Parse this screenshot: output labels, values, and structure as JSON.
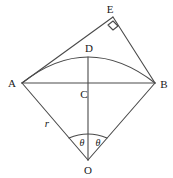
{
  "figure": {
    "background_color": "#ffffff",
    "stroke_color": "#4a4a4a",
    "text_color": "#1a1a1a",
    "width": 173,
    "height": 178
  },
  "points": {
    "A": {
      "label": "A",
      "x": 22,
      "y": 83,
      "label_x": 12,
      "label_y": 83
    },
    "B": {
      "label": "B",
      "x": 155,
      "y": 83,
      "label_x": 164,
      "label_y": 84
    },
    "C": {
      "label": "C",
      "x": 88,
      "y": 83,
      "label_x": 84,
      "label_y": 94
    },
    "D": {
      "label": "D",
      "x": 88,
      "y": 57,
      "label_x": 89,
      "label_y": 48
    },
    "E": {
      "label": "E",
      "x": 113,
      "y": 17,
      "label_x": 110,
      "label_y": 9
    },
    "O": {
      "label": "O",
      "x": 88,
      "y": 160,
      "label_x": 88,
      "label_y": 170
    }
  },
  "annotations": {
    "radius": {
      "label": "r",
      "x": 47,
      "y": 123
    },
    "angle_left": {
      "label": "θ",
      "x": 82,
      "y": 143
    },
    "angle_right": {
      "label": "θ",
      "x": 98,
      "y": 143
    },
    "right_angle_marker": {
      "at": "E",
      "present": true
    }
  },
  "segments": [
    {
      "name": "chord-AB",
      "from": "A",
      "to": "B"
    },
    {
      "name": "side-AE",
      "from": "A",
      "to": "E"
    },
    {
      "name": "side-EB",
      "from": "E",
      "to": "B"
    },
    {
      "name": "radius-AO",
      "from": "A",
      "to": "O"
    },
    {
      "name": "radius-BO",
      "from": "B",
      "to": "O"
    },
    {
      "name": "axis-DO",
      "from": "D",
      "to": "O"
    }
  ],
  "curves": [
    {
      "name": "arc-ADB",
      "from": "A",
      "through": "D",
      "to": "B"
    },
    {
      "name": "angle-arc-at-O",
      "center": "O",
      "radius": 26
    }
  ]
}
